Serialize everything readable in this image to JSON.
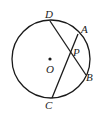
{
  "diagram": {
    "type": "circle-geometry",
    "circle": {
      "center_label": "O",
      "cx": 51,
      "cy": 59,
      "r": 39
    },
    "points": {
      "D": {
        "label": "D",
        "x": 50,
        "y": 21
      },
      "A": {
        "label": "A",
        "x": 78,
        "y": 34
      },
      "B": {
        "label": "B",
        "x": 86,
        "y": 75
      },
      "C": {
        "label": "C",
        "x": 52,
        "y": 98
      },
      "P": {
        "label": "P",
        "x": 69,
        "y": 53
      },
      "O": {
        "label": "O",
        "x": 50,
        "y": 59
      }
    },
    "chords": [
      "DB",
      "AC"
    ],
    "colors": {
      "stroke": "#1a1a1a",
      "background": "#ffffff"
    }
  }
}
